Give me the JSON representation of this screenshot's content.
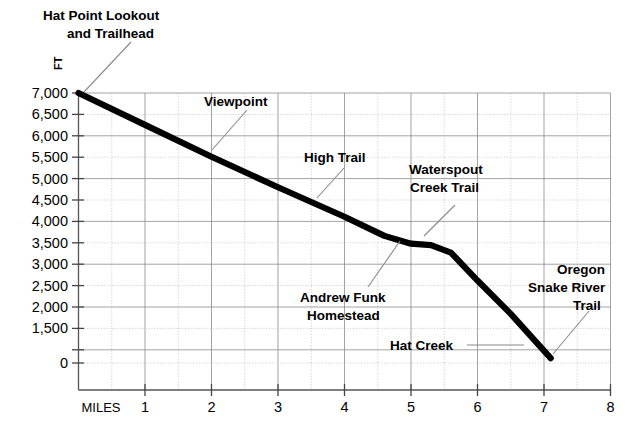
{
  "chart_data": {
    "type": "line",
    "title": "",
    "xlabel": "MILES",
    "ylabel": "FT",
    "xlim": [
      0,
      8
    ],
    "ylim": [
      0,
      7000
    ],
    "grid": true,
    "legend": "none",
    "x_ticks": [
      "1",
      "2",
      "3",
      "4",
      "5",
      "6",
      "7",
      "8"
    ],
    "x_tick_values": [
      1,
      2,
      3,
      4,
      5,
      6,
      7,
      8
    ],
    "y_ticks": [
      "0",
      "1,500",
      "2,000",
      "2,500",
      "3,000",
      "3,500",
      "4,000",
      "4,500",
      "5,000",
      "5,500",
      "6,000",
      "6,500",
      "7,000"
    ],
    "y_tick_values": [
      0,
      1500,
      2000,
      2500,
      3000,
      3500,
      4000,
      4500,
      5000,
      5500,
      6000,
      6500,
      7000
    ],
    "series": [
      {
        "name": "Hat Point to Snake River elevation profile",
        "x": [
          0.0,
          1.0,
          2.0,
          3.0,
          4.0,
          4.6,
          5.0,
          5.3,
          5.6,
          6.0,
          6.5,
          6.9,
          7.1
        ],
        "y": [
          7000,
          6350,
          5700,
          5080,
          4480,
          4090,
          3930,
          3900,
          3750,
          3180,
          2500,
          1900,
          1600
        ]
      }
    ],
    "annotations": [
      {
        "label": "Hat Point Lookout\nand Trailhead",
        "lines": [
          "Hat Point Lookout",
          "and Trailhead"
        ],
        "x": 0.0,
        "y": 7000
      },
      {
        "label": "Viewpoint",
        "lines": [
          "Viewpoint"
        ],
        "x": 2.05,
        "y": 5670
      },
      {
        "label": "High Trail",
        "lines": [
          "High Trail"
        ],
        "x": 3.35,
        "y": 4700
      },
      {
        "label": "Waterspout\nCreek Trail",
        "lines": [
          "Waterspout",
          "Creek Trail"
        ],
        "x": 5.2,
        "y": 3900
      },
      {
        "label": "Andrew Funk\nHomestead",
        "lines": [
          "Andrew Funk",
          "Homestead"
        ],
        "x": 4.75,
        "y": 4010
      },
      {
        "label": "Hat Creek",
        "lines": [
          "Hat Creek"
        ],
        "x": 6.45,
        "y": 2550
      },
      {
        "label": "Oregon\nSnake River\nTrail",
        "lines": [
          "Oregon",
          "Snake River",
          "Trail"
        ],
        "x": 7.1,
        "y": 1600
      }
    ]
  },
  "axis": {
    "y_unit_label": "FT",
    "x_unit_label": "MILES"
  },
  "colors": {
    "line": "#000000",
    "grid_major": "#8c8c8c",
    "grid_minor": "#bdbdbd",
    "axis": "#555555",
    "leader": "#8a8a8a",
    "background": "#ffffff"
  },
  "annotation_text": {
    "hat_point_l1": "Hat Point Lookout",
    "hat_point_l2": "and Trailhead",
    "viewpoint": "Viewpoint",
    "high_trail": "High Trail",
    "waterspout_l1": "Waterspout",
    "waterspout_l2": "Creek Trail",
    "andrew_funk_l1": "Andrew Funk",
    "andrew_funk_l2": "Homestead",
    "hat_creek": "Hat Creek",
    "oregon_l1": "Oregon",
    "oregon_l2": "Snake River",
    "oregon_l3": "Trail"
  },
  "y_tick_labels": {
    "t0": "0",
    "t1500": "1,500",
    "t2000": "2,000",
    "t2500": "2,500",
    "t3000": "3,000",
    "t3500": "3,500",
    "t4000": "4,000",
    "t4500": "4,500",
    "t5000": "5,000",
    "t5500": "5,500",
    "t6000": "6,000",
    "t6500": "6,500",
    "t7000": "7,000"
  },
  "x_tick_labels": {
    "m1": "1",
    "m2": "2",
    "m3": "3",
    "m4": "4",
    "m5": "5",
    "m6": "6",
    "m7": "7",
    "m8": "8"
  }
}
